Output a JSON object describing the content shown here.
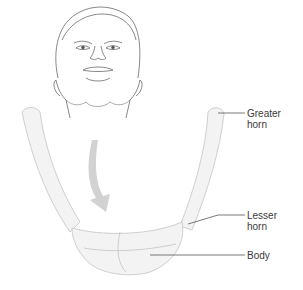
{
  "figure": {
    "labels": [
      {
        "id": "greater-horn",
        "line1": "Greater",
        "line2": "horn"
      },
      {
        "id": "lesser-horn",
        "line1": "Lesser",
        "line2": "horn"
      },
      {
        "id": "body",
        "line1": "Body",
        "line2": ""
      }
    ]
  },
  "colors": {
    "line_art": "#555555",
    "bone_fill": "#f1f1f1",
    "bone_outline": "#c8c8c8",
    "arrow": "#cfcfcf",
    "label_text": "#3a3a3a"
  }
}
